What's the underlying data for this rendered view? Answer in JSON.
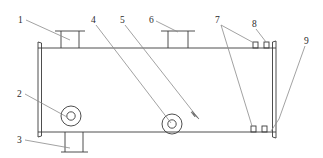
{
  "diagram": {
    "type": "engineering-line-drawing",
    "view": "side elevation",
    "canvas": {
      "width": 323,
      "height": 158
    },
    "stroke_color": "#3a3a3a",
    "background_color": "#ffffff",
    "line_width": 0.9
  },
  "callouts": [
    {
      "id": "1",
      "label": "1",
      "text_x": 20,
      "text_y": 22,
      "leader": [
        [
          26,
          20
        ],
        [
          63,
          36
        ]
      ]
    },
    {
      "id": "2",
      "label": "2",
      "text_x": 19,
      "text_y": 96,
      "leader": [
        [
          25,
          94
        ],
        [
          66,
          116
        ]
      ]
    },
    {
      "id": "3",
      "label": "3",
      "text_x": 19,
      "text_y": 142,
      "leader": [
        [
          25,
          140
        ],
        [
          68,
          148
        ]
      ]
    },
    {
      "id": "4",
      "label": "4",
      "text_x": 92,
      "text_y": 22,
      "leader": [
        [
          96,
          25
        ],
        [
          170,
          124
        ]
      ]
    },
    {
      "id": "5",
      "label": "5",
      "text_x": 121,
      "text_y": 22,
      "leader": [
        [
          125,
          25
        ],
        [
          199,
          119
        ]
      ]
    },
    {
      "id": "6",
      "label": "6",
      "text_x": 150,
      "text_y": 22,
      "leader": [
        [
          156,
          20
        ],
        [
          178,
          32
        ]
      ]
    },
    {
      "id": "7",
      "label": "7",
      "text_x": 216,
      "text_y": 22,
      "leader_a": [
        [
          221,
          25
        ],
        [
          255,
          44
        ]
      ],
      "leader_b": [
        [
          221,
          25
        ],
        [
          252,
          133
        ]
      ]
    },
    {
      "id": "8",
      "label": "8",
      "text_x": 253,
      "text_y": 26,
      "leader": [
        [
          256,
          29
        ],
        [
          266,
          43
        ]
      ]
    },
    {
      "id": "9",
      "label": "9",
      "text_x": 306,
      "text_y": 43,
      "leader": [
        [
          305,
          46
        ],
        [
          279,
          119
        ]
      ]
    }
  ],
  "shell": {
    "name": "vessel-shell",
    "left_x": 38,
    "right_x": 276,
    "top_y": 48,
    "bottom_y": 132
  },
  "heads": [
    {
      "name": "left-head-flange",
      "x": 38,
      "top_y": 42,
      "bottom_y": 137
    },
    {
      "name": "right-head-flange",
      "x": 276,
      "top_y": 41,
      "bottom_y": 138
    }
  ],
  "top_nozzles": [
    {
      "name": "top-nozzle-left",
      "center_x": 70,
      "neck_half_width": 9,
      "flange_half_width": 15,
      "flange_y": 31
    },
    {
      "name": "top-nozzle-right",
      "center_x": 178,
      "neck_half_width": 10,
      "flange_half_width": 17,
      "flange_y": 31
    }
  ],
  "bottom_nozzles": [
    {
      "name": "bottom-nozzle-drain",
      "center_x": 74,
      "neck_half_width": 9,
      "flange_half_width": 13,
      "flange_y": 152
    }
  ],
  "manways": [
    {
      "name": "manway-flange-left",
      "cx": 71,
      "cy": 116,
      "r_outer": 10,
      "r_inner": 4.2
    },
    {
      "name": "manway-flange-center",
      "cx": 172,
      "cy": 124,
      "r_outer": 10,
      "r_inner": 4.2
    }
  ],
  "small_fittings": [
    {
      "name": "fitting-top-a",
      "x": 253,
      "y": 42,
      "w": 5,
      "h": 6
    },
    {
      "name": "fitting-top-b",
      "x": 264,
      "y": 42,
      "w": 5,
      "h": 6
    },
    {
      "name": "fitting-bottom-a",
      "x": 251,
      "y": 128,
      "w": 5,
      "h": 6
    },
    {
      "name": "fitting-bottom-b",
      "x": 262,
      "y": 128,
      "w": 5,
      "h": 6
    }
  ],
  "arrow": {
    "name": "leader-arrowhead",
    "tip_x": 199,
    "tip_y": 119,
    "points": "199,119 192,113 195,117 193,112"
  }
}
